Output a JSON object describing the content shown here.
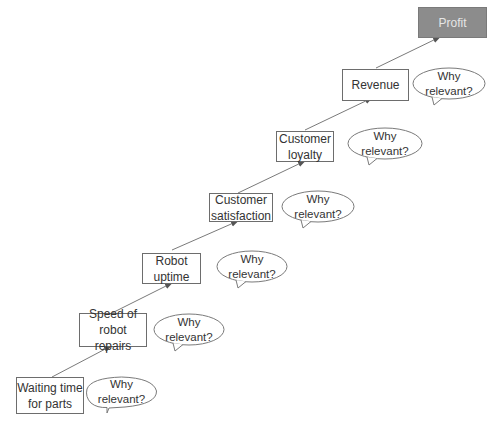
{
  "diagram": {
    "title": "",
    "nodes": [
      {
        "id": "waiting",
        "label_line1": "Waiting time",
        "label_line2": "for parts",
        "bubble_line1": "Why",
        "bubble_line2": "relevant?"
      },
      {
        "id": "speed",
        "label_line1": "Speed of",
        "label_line2": "robot repairs",
        "bubble_line1": "Why",
        "bubble_line2": "relevant?"
      },
      {
        "id": "uptime",
        "label_line1": "Robot",
        "label_line2": "uptime",
        "bubble_line1": "Why",
        "bubble_line2": "relevant?"
      },
      {
        "id": "satisfaction",
        "label_line1": "Customer",
        "label_line2": "satisfaction",
        "bubble_line1": "Why",
        "bubble_line2": "relevant?"
      },
      {
        "id": "loyalty",
        "label_line1": "Customer",
        "label_line2": "loyalty",
        "bubble_line1": "Why",
        "bubble_line2": "relevant?"
      },
      {
        "id": "revenue",
        "label_line1": "Revenue",
        "label_line2": "",
        "bubble_line1": "Why",
        "bubble_line2": "relevant?"
      },
      {
        "id": "profit",
        "label_line1": "Profit",
        "label_line2": ""
      }
    ],
    "edges": [
      [
        "waiting",
        "speed"
      ],
      [
        "speed",
        "uptime"
      ],
      [
        "uptime",
        "satisfaction"
      ],
      [
        "satisfaction",
        "loyalty"
      ],
      [
        "loyalty",
        "revenue"
      ],
      [
        "revenue",
        "profit"
      ]
    ],
    "colors": {
      "box_border": "#6d6d6d",
      "profit_fill": "#8c8c8c",
      "profit_text": "#e6e6e6",
      "arrow": "#6a6a6a"
    }
  }
}
